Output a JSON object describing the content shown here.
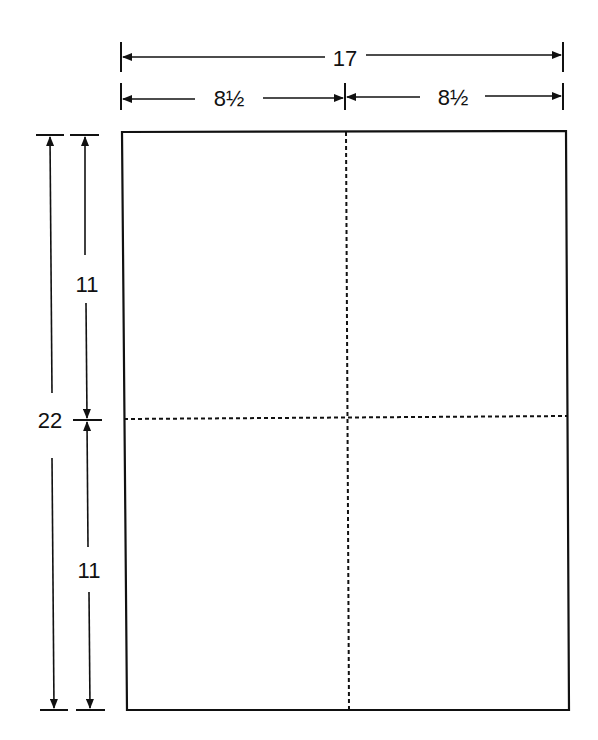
{
  "diagram": {
    "colors": {
      "line": "#111111",
      "background": "#ffffff"
    },
    "dimensions": {
      "overall_width": "17",
      "left_half_width": "8½",
      "right_half_width": "8½",
      "overall_height": "22",
      "top_half_height": "11",
      "bottom_half_height": "11"
    },
    "sheet": {
      "divisions": {
        "columns": 2,
        "rows": 2
      },
      "fold_lines": "dashed"
    }
  }
}
